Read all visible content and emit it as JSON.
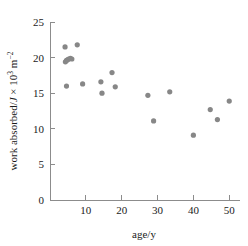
{
  "chart_data": {
    "type": "scatter",
    "title": "",
    "xlabel": "age/y",
    "ylabel": "work absorbed/J × 10³ m⁻²",
    "ylabel_parts": {
      "main": "work absorbed/",
      "italic_unit": "J",
      "times": " × 10",
      "exp1": "3",
      "unit2": " m",
      "exp2": "−2"
    },
    "xlim": [
      0,
      53
    ],
    "ylim": [
      0,
      25
    ],
    "xticks": [
      0,
      10,
      20,
      30,
      40,
      50
    ],
    "xtick_labels": [
      "",
      "10",
      "20",
      "30",
      "40",
      "50"
    ],
    "yticks": [
      0,
      5,
      10,
      15,
      20,
      25
    ],
    "ytick_labels": [
      "0",
      "5",
      "10",
      "15",
      "20",
      "25"
    ],
    "grid": false,
    "legend": false,
    "marker_color": "#878787",
    "axis_color": "#8c8c8c",
    "marker_size": 2.6,
    "points": [
      {
        "x": 4.2,
        "y": 21.5
      },
      {
        "x": 4.3,
        "y": 19.4
      },
      {
        "x": 4.6,
        "y": 19.6
      },
      {
        "x": 4.9,
        "y": 19.7
      },
      {
        "x": 5.2,
        "y": 19.8
      },
      {
        "x": 5.7,
        "y": 19.9
      },
      {
        "x": 6.1,
        "y": 19.8
      },
      {
        "x": 4.6,
        "y": 16.0
      },
      {
        "x": 7.6,
        "y": 21.8
      },
      {
        "x": 9.1,
        "y": 16.3
      },
      {
        "x": 14.2,
        "y": 16.6
      },
      {
        "x": 14.5,
        "y": 15.0
      },
      {
        "x": 17.3,
        "y": 17.9
      },
      {
        "x": 18.2,
        "y": 15.9
      },
      {
        "x": 27.3,
        "y": 14.7
      },
      {
        "x": 28.9,
        "y": 11.1
      },
      {
        "x": 33.4,
        "y": 15.2
      },
      {
        "x": 40.0,
        "y": 9.1
      },
      {
        "x": 44.7,
        "y": 12.7
      },
      {
        "x": 46.7,
        "y": 11.3
      },
      {
        "x": 50.0,
        "y": 13.9
      }
    ]
  }
}
